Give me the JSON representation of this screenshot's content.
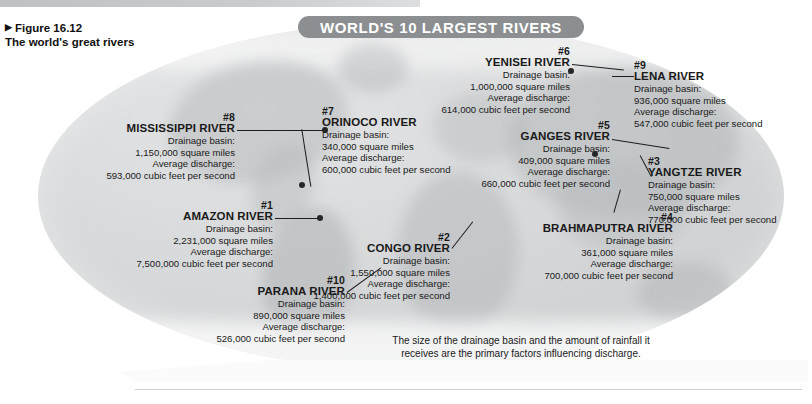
{
  "figure": {
    "arrow_glyph": "▶",
    "number": "Figure 16.12",
    "caption": "The world's great rivers"
  },
  "map": {
    "title": "WORLD'S 10 LARGEST RIVERS",
    "banner_color": "#8c8f92",
    "ocean_color": "#d4d6d7",
    "land_color": "#b0b3b6",
    "note": "The size of the drainage basin and the amount of rainfall it receives are the primary factors influencing discharge."
  },
  "labels": {
    "drainage_basin": "Drainage basin:",
    "average_discharge": "Average discharge:"
  },
  "rivers": [
    {
      "rank": "#1",
      "name": "AMAZON RIVER",
      "basin": "2,231,000 square miles",
      "discharge": "7,500,000 cubic feet per second"
    },
    {
      "rank": "#2",
      "name": "CONGO RIVER",
      "basin": "1,550,000 square miles",
      "discharge": "1,400,000 cubic feet per second"
    },
    {
      "rank": "#3",
      "name": "YANGTZE RIVER",
      "basin": "750,000 square miles",
      "discharge": "770,000 cubic feet per second"
    },
    {
      "rank": "#4",
      "name": "BRAHMAPUTRA RIVER",
      "basin": "361,000 square miles",
      "discharge": "700,000 cubic feet per second"
    },
    {
      "rank": "#5",
      "name": "GANGES RIVER",
      "basin": "409,000 square miles",
      "discharge": "660,000 cubic feet per second"
    },
    {
      "rank": "#6",
      "name": "YENISEI RIVER",
      "basin": "1,000,000 square miles",
      "discharge": "614,000 cubic feet per second"
    },
    {
      "rank": "#7",
      "name": "ORINOCO RIVER",
      "basin": "340,000 square miles",
      "discharge": "600,000 cubic feet per second"
    },
    {
      "rank": "#8",
      "name": "MISSISSIPPI RIVER",
      "basin": "1,150,000 square miles",
      "discharge": "593,000 cubic feet per second"
    },
    {
      "rank": "#9",
      "name": "LENA RIVER",
      "basin": "936,000 square miles",
      "discharge": "547,000 cubic feet per second"
    },
    {
      "rank": "#10",
      "name": "PARANA RIVER",
      "basin": "890,000 square miles",
      "discharge": "526,000 cubic feet per second"
    }
  ]
}
